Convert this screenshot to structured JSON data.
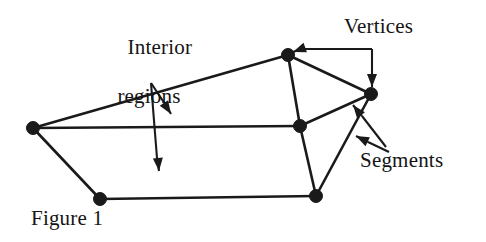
{
  "figure": {
    "caption": "Figure 1",
    "background_color": "#ffffff",
    "ink_color": "#1a1a1a",
    "width": 486,
    "height": 242
  },
  "labels": {
    "interior_regions_line1": "Interior",
    "interior_regions_line2": "regions",
    "vertices": "Vertices",
    "segments": "Segments"
  },
  "chart_data": {
    "type": "diagram",
    "title": "Figure 1",
    "vertices": [
      {
        "id": "v-left",
        "x": 33,
        "y": 128,
        "radius": 6.5
      },
      {
        "id": "v-top",
        "x": 288,
        "y": 55,
        "radius": 6.5
      },
      {
        "id": "v-right",
        "x": 371,
        "y": 94,
        "radius": 6.5
      },
      {
        "id": "v-center",
        "x": 300,
        "y": 126,
        "radius": 6.5
      },
      {
        "id": "v-bottom-right",
        "x": 316,
        "y": 196,
        "radius": 6.5
      },
      {
        "id": "v-bottom-left",
        "x": 100,
        "y": 199,
        "radius": 6.5
      }
    ],
    "segments": [
      {
        "from": "v-left",
        "to": "v-top"
      },
      {
        "from": "v-top",
        "to": "v-right"
      },
      {
        "from": "v-top",
        "to": "v-center"
      },
      {
        "from": "v-left",
        "to": "v-center"
      },
      {
        "from": "v-center",
        "to": "v-right"
      },
      {
        "from": "v-center",
        "to": "v-bottom-right"
      },
      {
        "from": "v-right",
        "to": "v-bottom-right"
      },
      {
        "from": "v-bottom-right",
        "to": "v-bottom-left"
      },
      {
        "from": "v-left",
        "to": "v-bottom-left"
      }
    ],
    "leaders": [
      {
        "id": "leader-vertices-top",
        "label": "Vertices",
        "kind": "elbow",
        "points": [
          [
            372,
            49
          ],
          [
            301,
            49
          ]
        ],
        "arrow_tip": [
          293,
          52
        ],
        "arrow_angle_deg": 160
      },
      {
        "id": "leader-vertices-right",
        "label": "Vertices",
        "kind": "elbow",
        "points": [
          [
            372,
            49
          ],
          [
            372,
            78
          ]
        ],
        "arrow_tip": [
          372,
          87
        ],
        "arrow_angle_deg": 90
      },
      {
        "id": "leader-segments-upper",
        "label": "Segments",
        "kind": "straight",
        "points": [
          [
            386,
            147
          ],
          [
            362,
            116
          ]
        ],
        "arrow_tip": [
          353,
          105
        ],
        "arrow_angle_deg": 232
      },
      {
        "id": "leader-segments-lower",
        "label": "Segments",
        "kind": "straight",
        "points": [
          [
            389,
            152
          ],
          [
            368,
            142
          ]
        ],
        "arrow_tip": [
          356,
          136
        ],
        "arrow_angle_deg": 206
      },
      {
        "id": "leader-interior-short",
        "label": "Interior regions",
        "kind": "straight",
        "points": [
          [
            151,
            83
          ],
          [
            165,
            104
          ]
        ],
        "arrow_tip": [
          171,
          114
        ],
        "arrow_angle_deg": 57
      },
      {
        "id": "leader-interior-long",
        "label": "Interior regions",
        "kind": "straight",
        "points": [
          [
            151,
            83
          ],
          [
            157,
            158
          ]
        ],
        "arrow_tip": [
          159,
          171
        ],
        "arrow_angle_deg": 85
      }
    ]
  }
}
